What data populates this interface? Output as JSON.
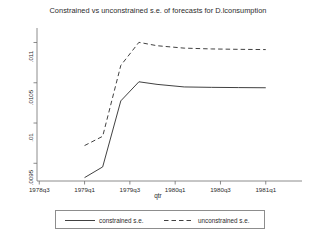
{
  "chart_data": {
    "type": "line",
    "title": "Constrained vs unconstrained s.e. of forecasts for D.lconsumption",
    "xlabel": "qtr",
    "ylabel": "",
    "grid": false,
    "legend_position": "bottom",
    "xtick_labels": [
      "1978q3",
      "1979q1",
      "1979q3",
      "1980q1",
      "1980q3",
      "1981q1"
    ],
    "xtick_values": [
      0,
      2,
      4,
      6,
      8,
      10
    ],
    "ytick_labels": [
      ".0095",
      ".01",
      ".0105",
      ".011"
    ],
    "ytick_values": [
      0.0095,
      0.01,
      0.0105,
      0.011
    ],
    "xlim": [
      -0.1,
      11.6
    ],
    "ylim": [
      0.00928,
      0.01118
    ],
    "x": [
      2,
      2.8,
      3.6,
      4.4,
      5.2,
      6.4,
      7.6,
      8.8,
      10
    ],
    "series": [
      {
        "name": "constrained s.e.",
        "style": "solid",
        "color": "#2b2b2b",
        "values": [
          0.009322,
          0.009455,
          0.010275,
          0.010512,
          0.01048,
          0.010448,
          0.010443,
          0.01044,
          0.010438
        ]
      },
      {
        "name": "unconstrained s.e.",
        "style": "dashed",
        "color": "#2b2b2b",
        "values": [
          0.00972,
          0.009835,
          0.010715,
          0.011002,
          0.01096,
          0.01093,
          0.01092,
          0.010915,
          0.010912
        ]
      }
    ]
  },
  "legend": {
    "constrained_label": "constrained s.e.",
    "unconstrained_label": "unconstrained s.e."
  },
  "axes": {
    "x_title": "qtr"
  },
  "colors": {
    "line": "#2b2b2b",
    "axis": "#6e6e6e",
    "background": "#ffffff",
    "legend_border": "#8d8d8d"
  }
}
